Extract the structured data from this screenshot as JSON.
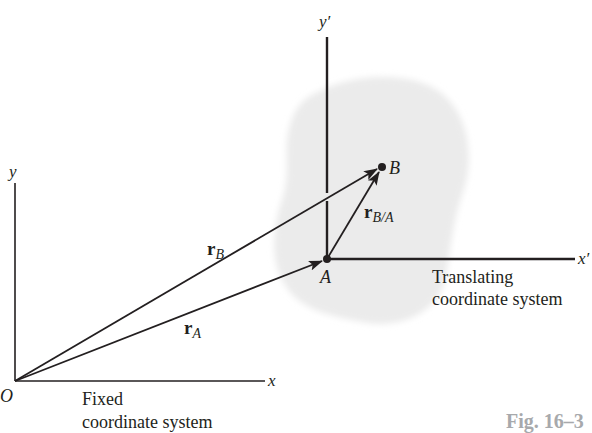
{
  "diagram": {
    "type": "relative-motion-translating-axes",
    "colors": {
      "ink": "#231f20",
      "body_fill": "#ebebeb",
      "caption": "#a7a9ac"
    },
    "fixed_frame": {
      "origin_label": "O",
      "x_label": "x",
      "y_label": "y",
      "caption_line1": "Fixed",
      "caption_line2": "coordinate system"
    },
    "translating_frame": {
      "origin_label": "A",
      "x_label": "x′",
      "y_label": "y′",
      "caption_line1": "Translating",
      "caption_line2": "coordinate system"
    },
    "points": {
      "A": "A",
      "B": "B"
    },
    "vectors": {
      "r_A": {
        "symbol": "r",
        "subscript": "A",
        "from": "O",
        "to": "A"
      },
      "r_B": {
        "symbol": "r",
        "subscript": "B",
        "from": "O",
        "to": "B"
      },
      "r_BA": {
        "symbol": "r",
        "subscript": "B/A",
        "from": "A",
        "to": "B"
      }
    },
    "figure_label": "Fig. 16–3"
  }
}
